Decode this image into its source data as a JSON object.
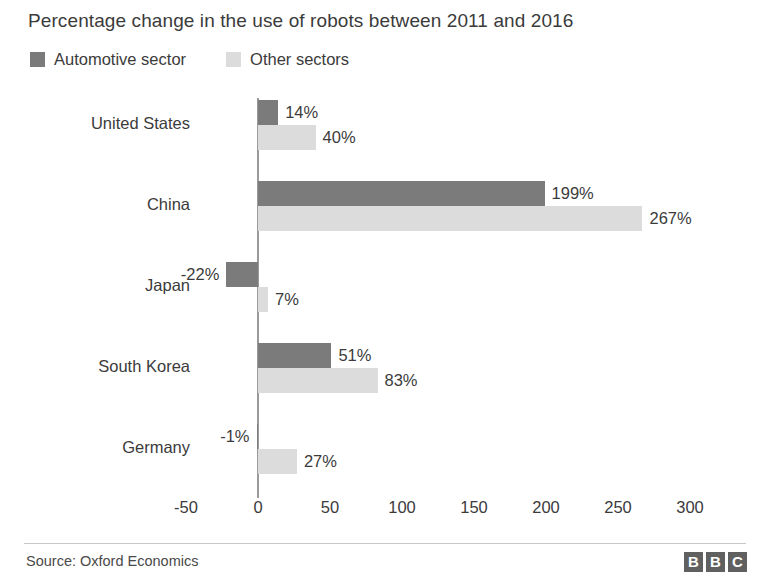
{
  "chart_data": {
    "type": "bar",
    "orientation": "horizontal",
    "title": "Percentage change in the use of robots between 2011 and 2016",
    "xlabel": "",
    "ylabel": "",
    "xlim": [
      -50,
      300
    ],
    "xticks": [
      "-50",
      "0",
      "50",
      "100",
      "150",
      "200",
      "250",
      "300"
    ],
    "xtick_values": [
      -50,
      0,
      50,
      100,
      150,
      200,
      250,
      300
    ],
    "grid": false,
    "legend_position": "top-left",
    "categories": [
      "United States",
      "China",
      "Japan",
      "South Korea",
      "Germany"
    ],
    "series": [
      {
        "name": "Automotive sector",
        "color": "#7b7b7b",
        "values": [
          14,
          199,
          -22,
          51,
          -1
        ],
        "labels": [
          "14%",
          "199%",
          "-22%",
          "51%",
          "-1%"
        ]
      },
      {
        "name": "Other sectors",
        "color": "#dcdcdc",
        "values": [
          40,
          267,
          7,
          83,
          27
        ],
        "labels": [
          "40%",
          "267%",
          "7%",
          "83%",
          "27%"
        ]
      }
    ]
  },
  "legend": {
    "items": [
      {
        "label": "Automotive sector",
        "color": "#7b7b7b"
      },
      {
        "label": "Other sectors",
        "color": "#dcdcdc"
      }
    ]
  },
  "footer": {
    "source": "Source: Oxford Economics",
    "logo": [
      "B",
      "B",
      "C"
    ]
  }
}
